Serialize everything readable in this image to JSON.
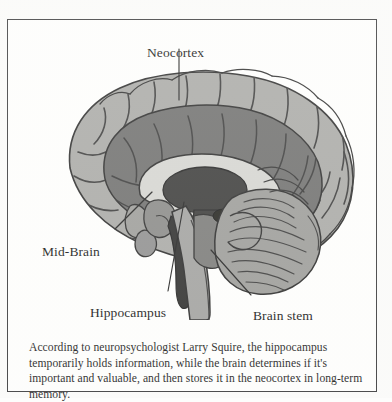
{
  "figure": {
    "type": "brain-anatomy-diagram",
    "view": "mid-sagittal section of human brain",
    "border_color": "#3a3a3c",
    "background_color": "#fefefd"
  },
  "labels": {
    "neocortex": "Neocortex",
    "mid_brain": "Mid-Brain",
    "hippocampus": "Hippocampus",
    "brain_stem": "Brain stem"
  },
  "caption": {
    "text": "According to neuropsychologist Larry Squire, the hippocampus temporarily holds information, while the brain determines if it's important and valuable, and then stores it in the neocortex in long-term memory."
  },
  "palette": {
    "cortex_light": "#a8a8a6",
    "cortex_mid": "#8c8c8a",
    "cortex_dark": "#6e6e6d",
    "deep_structure": "#4a4a49",
    "thalamus": "#3c3c3b",
    "outline": "#2a2a2a",
    "white_matter": "#d8d8d4",
    "leader_line": "#2b2b2b"
  }
}
